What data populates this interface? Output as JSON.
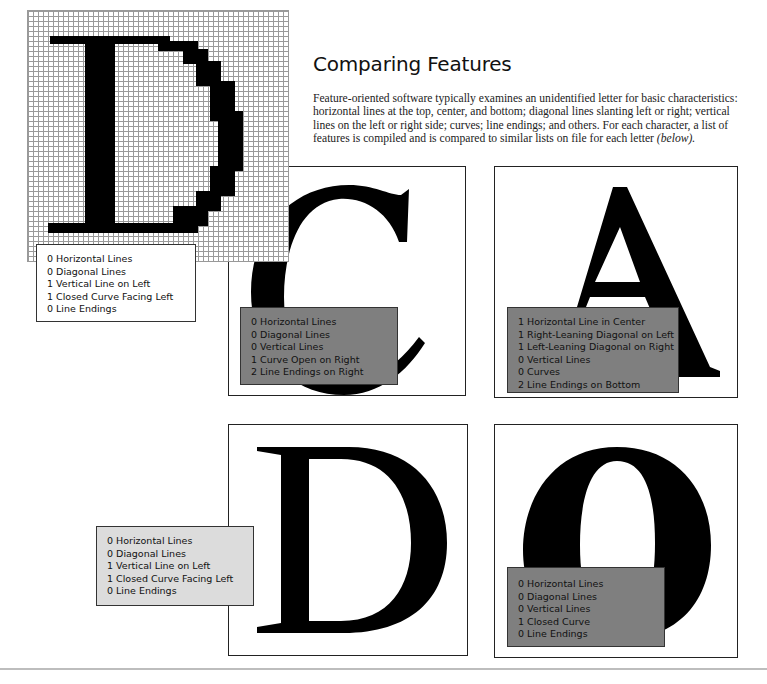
{
  "heading": {
    "title": "Comparing Features",
    "body": "Feature-oriented software typically examines an unidentified letter for basic characteristics: horizontal lines at the top, center, and bottom; diagonal lines slanting left or right; vertical lines on the left or right side; curves; line endings; and others. For each character, a list of features is compiled and is compared to similar lists on file for each letter",
    "body_suffix": "(below)."
  },
  "unknown_letter": {
    "glyph": "D",
    "style": "pixel-grid",
    "features": [
      "0 Horizontal Lines",
      "0 Diagonal Lines",
      "1 Vertical Line on Left",
      "1 Closed Curve Facing Left",
      "0 Line Endings"
    ]
  },
  "panels": [
    {
      "letter": "C",
      "features": [
        "0 Horizontal Lines",
        "0 Diagonal Lines",
        "0 Vertical Lines",
        "1 Curve Open on Right",
        "2 Line Endings on Right"
      ]
    },
    {
      "letter": "A",
      "features": [
        "1 Horizontal Line in Center",
        "1 Right-Leaning Diagonal on Left",
        "1 Left-Leaning Diagonal on Right",
        "0 Vertical Lines",
        "0 Curves",
        "2 Line Endings on Bottom"
      ]
    },
    {
      "letter": "D",
      "features": [
        "0 Horizontal Lines",
        "0 Diagonal Lines",
        "1 Vertical Line on Left",
        "1 Closed Curve Facing Left",
        "0 Line Endings"
      ]
    },
    {
      "letter": "O",
      "features": [
        "0 Horizontal Lines",
        "0 Diagonal Lines",
        "0 Vertical Lines",
        "1 Closed Curve",
        "0 Line Endings"
      ]
    }
  ],
  "colors": {
    "dark_box": "#7f7f7f",
    "light_box": "#dcdcdc",
    "grid_line": "#9a9a9a"
  }
}
